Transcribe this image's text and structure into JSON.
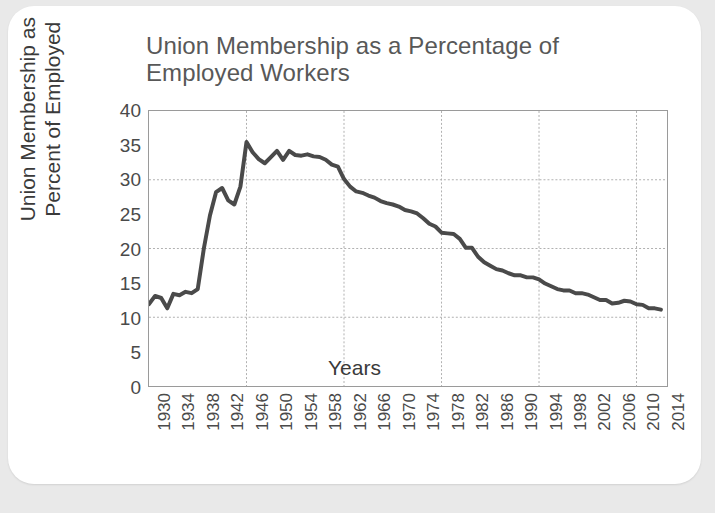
{
  "card": {
    "background": "#ffffff",
    "page_background": "#e9e9e9"
  },
  "chart_data": {
    "type": "line",
    "title": "Union Membership as a Percentage of Employed Workers",
    "xlabel": "Years",
    "ylabel": "Union Membership as Percent of Employed",
    "ylabel_line1": "Union Membership as",
    "ylabel_line2": "Percent of Employed",
    "xlim": [
      1930,
      2015
    ],
    "ylim": [
      0,
      40
    ],
    "yticks": [
      0,
      5,
      10,
      15,
      20,
      25,
      30,
      35,
      40
    ],
    "ytick_labels": [
      "0",
      "5",
      "10",
      "15",
      "20",
      "25",
      "30",
      "35",
      "40"
    ],
    "xticks": [
      1930,
      1934,
      1938,
      1942,
      1946,
      1950,
      1954,
      1958,
      1962,
      1966,
      1970,
      1974,
      1978,
      1982,
      1986,
      1990,
      1994,
      1998,
      2002,
      2006,
      2010,
      2014
    ],
    "xtick_labels": [
      "1930",
      "1934",
      "1938",
      "1942",
      "1946",
      "1950",
      "1954",
      "1958",
      "1962",
      "1966",
      "1970",
      "1974",
      "1978",
      "1982",
      "1986",
      "1990",
      "1994",
      "1998",
      "2002",
      "2006",
      "2010",
      "2014"
    ],
    "gridlines": {
      "horizontal_at": [
        10,
        20,
        30
      ],
      "vertical_at": [
        1946,
        1962,
        1978,
        1994,
        2010
      ],
      "style": "dotted",
      "color": "#b0b0b0"
    },
    "line_color": "#4a4a4a",
    "line_width": 4,
    "legend": "none",
    "x": [
      1930,
      1931,
      1932,
      1933,
      1934,
      1935,
      1936,
      1937,
      1938,
      1939,
      1940,
      1941,
      1942,
      1943,
      1944,
      1945,
      1946,
      1947,
      1948,
      1949,
      1950,
      1951,
      1952,
      1953,
      1954,
      1955,
      1956,
      1957,
      1958,
      1959,
      1960,
      1961,
      1962,
      1963,
      1964,
      1965,
      1966,
      1967,
      1968,
      1969,
      1970,
      1971,
      1972,
      1973,
      1974,
      1975,
      1976,
      1977,
      1978,
      1979,
      1980,
      1981,
      1982,
      1983,
      1984,
      1985,
      1986,
      1987,
      1988,
      1989,
      1990,
      1991,
      1992,
      1993,
      1994,
      1995,
      1996,
      1997,
      1998,
      1999,
      2000,
      2001,
      2002,
      2003,
      2004,
      2005,
      2006,
      2007,
      2008,
      2009,
      2010,
      2011,
      2012,
      2013,
      2014
    ],
    "y": [
      11.9,
      13.1,
      12.8,
      11.3,
      13.4,
      13.2,
      13.7,
      13.5,
      14.1,
      20.0,
      24.8,
      28.2,
      28.8,
      27.0,
      26.4,
      29.0,
      35.5,
      34.0,
      33.0,
      32.4,
      33.3,
      34.2,
      32.9,
      34.2,
      33.6,
      33.5,
      33.7,
      33.4,
      33.3,
      32.9,
      32.2,
      31.9,
      30.1,
      29.0,
      28.3,
      28.1,
      27.7,
      27.4,
      26.9,
      26.6,
      26.4,
      26.1,
      25.6,
      25.4,
      25.1,
      24.4,
      23.6,
      23.2,
      22.3,
      22.2,
      22.1,
      21.4,
      20.1,
      20.1,
      18.8,
      18.0,
      17.5,
      17.0,
      16.8,
      16.4,
      16.1,
      16.1,
      15.8,
      15.8,
      15.5,
      14.9,
      14.5,
      14.1,
      13.9,
      13.9,
      13.5,
      13.5,
      13.3,
      12.9,
      12.5,
      12.5,
      12.0,
      12.1,
      12.4,
      12.3,
      11.9,
      11.8,
      11.3,
      11.3,
      11.1
    ]
  }
}
